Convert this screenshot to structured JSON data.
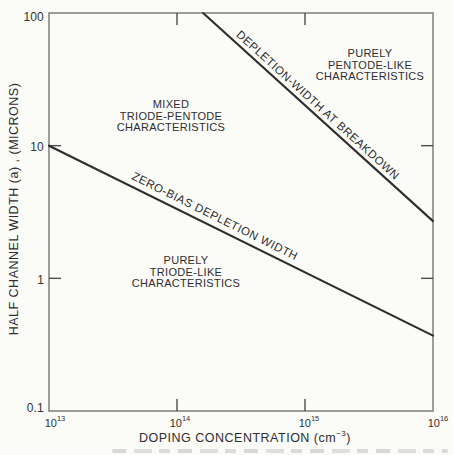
{
  "figure": {
    "x_axis": {
      "title_main": "DOPING CONCENTRATION (cm",
      "title_sup": "−3",
      "title_close": ")",
      "ticks": [
        {
          "base": "10",
          "exp": "13"
        },
        {
          "base": "10",
          "exp": "14"
        },
        {
          "base": "10",
          "exp": "15"
        },
        {
          "base": "10",
          "exp": "16"
        }
      ]
    },
    "y_axis": {
      "title": "HALF CHANNEL WIDTH (a)  ,  (MICRONS)",
      "ticks": [
        "100",
        "10",
        "1",
        "0.1"
      ]
    },
    "regions": {
      "pentode": {
        "lines": [
          "PURELY",
          "PENTODE-LIKE",
          "CHARACTERISTICS"
        ]
      },
      "mixed": {
        "lines": [
          "MIXED",
          "TRIODE-PENTODE",
          "CHARACTERISTICS"
        ]
      },
      "triode": {
        "lines": [
          "PURELY",
          "TRIODE-LIKE",
          "CHARACTERISTICS"
        ]
      }
    },
    "line_labels": {
      "breakdown": "DEPLETION-WIDTH AT BREAKDOWN",
      "zero_bias": "ZERO-BIAS DEPLETION WIDTH"
    }
  },
  "chart_data": {
    "type": "line",
    "x_scale": "log",
    "y_scale": "log",
    "xlim": [
      10000000000000.0,
      1e+16
    ],
    "ylim": [
      0.1,
      100
    ],
    "xlabel": "DOPING CONCENTRATION (cm⁻³)",
    "ylabel": "HALF CHANNEL WIDTH (a) , (MICRONS)",
    "x_ticks": [
      10000000000000.0,
      100000000000000.0,
      1000000000000000.0,
      1e+16
    ],
    "x_tick_labels": [
      "10^13",
      "10^14",
      "10^15",
      "10^16"
    ],
    "y_ticks": [
      0.1,
      1,
      10,
      100
    ],
    "y_tick_labels": [
      "0.1",
      "1",
      "10",
      "100"
    ],
    "grid": false,
    "legend": "labels drawn along lines",
    "series": [
      {
        "name": "DEPLETION-WIDTH AT BREAKDOWN",
        "points": [
          [
            160000000000000.0,
            100
          ],
          [
            1e+16,
            2.7
          ]
        ]
      },
      {
        "name": "ZERO-BIAS DEPLETION WIDTH",
        "points": [
          [
            10000000000000.0,
            10
          ],
          [
            1e+16,
            0.37
          ]
        ]
      }
    ],
    "annotations": [
      {
        "text": "PURELY PENTODE-LIKE CHARACTERISTICS",
        "x": 3200000000000000.0,
        "y": 40
      },
      {
        "text": "MIXED TRIODE-PENTODE CHARACTERISTICS",
        "x": 90000000000000.0,
        "y": 17
      },
      {
        "text": "PURELY TRIODE-LIKE CHARACTERISTICS",
        "x": 120000000000000.0,
        "y": 1.1
      }
    ],
    "colors": {
      "line": "#2e2e2e",
      "axis": "#858585",
      "tick": "#4c4c4c",
      "text": "#2e2e2e",
      "background": "#fbfbf8"
    }
  }
}
